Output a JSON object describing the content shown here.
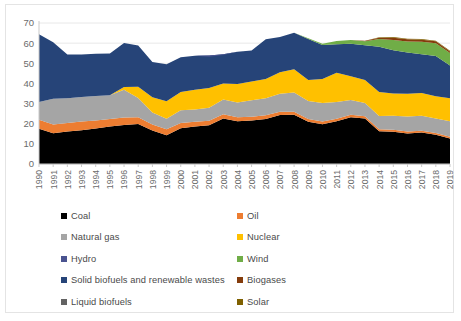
{
  "chart_data": {
    "type": "area",
    "stacked": true,
    "title": "",
    "subtitle": "",
    "xlabel": "",
    "ylabel": "",
    "ylim": [
      0,
      70
    ],
    "yticks": [
      0,
      10,
      20,
      30,
      40,
      50,
      60,
      70
    ],
    "ytick_labels": [
      "0",
      "10",
      "20",
      "30",
      "40",
      "50",
      "60",
      "70"
    ],
    "grid": true,
    "grid_axis": "y",
    "legend_position": "bottom",
    "legend_columns": 2,
    "categories": [
      "1990",
      "1991",
      "1992",
      "1993",
      "1994",
      "1995",
      "1996",
      "1997",
      "1998",
      "1999",
      "2000",
      "2001",
      "2002",
      "2003",
      "2004",
      "2005",
      "2006",
      "2007",
      "2008",
      "2009",
      "2010",
      "2011",
      "2012",
      "2013",
      "2014",
      "2015",
      "2016",
      "2017",
      "2018",
      "2019"
    ],
    "series": [
      {
        "name": "Coal",
        "color": "#000000",
        "values": [
          17.5,
          15.3,
          16.1,
          16.8,
          17.6,
          18.6,
          19.4,
          19.8,
          16.6,
          14.3,
          17.8,
          18.6,
          19.2,
          22.6,
          21.2,
          21.6,
          22.4,
          24.3,
          24.5,
          21.0,
          19.7,
          21.2,
          23.2,
          22.6,
          16.2,
          16.0,
          15.1,
          15.6,
          14.5,
          12.6
        ]
      },
      {
        "name": "Oil",
        "color": "#ED7D31",
        "values": [
          4.5,
          4.3,
          4.3,
          4.3,
          4.0,
          3.8,
          3.7,
          3.4,
          3.0,
          2.9,
          2.6,
          2.4,
          2.3,
          2.1,
          2.0,
          1.9,
          1.8,
          1.6,
          1.5,
          1.4,
          1.4,
          1.3,
          1.2,
          1.1,
          1.1,
          1.0,
          1.0,
          0.9,
          0.9,
          0.9
        ]
      },
      {
        "name": "Natural gas",
        "color": "#A5A5A5",
        "values": [
          8.8,
          12.8,
          12.3,
          12.2,
          12.1,
          11.7,
          13.8,
          9.6,
          6.0,
          5.3,
          6.3,
          6.0,
          6.4,
          7.3,
          7.3,
          8.2,
          8.4,
          9.0,
          9.5,
          8.9,
          9.2,
          8.3,
          7.4,
          6.6,
          6.5,
          6.9,
          7.5,
          7.5,
          7.2,
          7.7
        ]
      },
      {
        "name": "Nuclear",
        "color": "#FFC000",
        "values": [
          0.0,
          0.0,
          0.0,
          0.0,
          0.0,
          0.0,
          1.3,
          5.6,
          7.6,
          8.6,
          9.1,
          9.8,
          9.8,
          8.0,
          9.2,
          9.3,
          9.6,
          10.7,
          11.5,
          10.4,
          11.9,
          14.5,
          11.8,
          11.4,
          11.9,
          11.1,
          11.3,
          11.3,
          11.0,
          11.5
        ]
      },
      {
        "name": "Hydro",
        "color": "#4A5390"
      },
      {
        "name": "Wind",
        "color": "#70AD47",
        "values": [
          0.0,
          0.0,
          0.0,
          0.0,
          0.0,
          0.0,
          0.0,
          0.0,
          0.0,
          0.0,
          0.0,
          0.0,
          0.0,
          0.0,
          0.0,
          0.0,
          0.0,
          0.0,
          0.0,
          0.3,
          0.6,
          1.6,
          1.8,
          2.0,
          3.8,
          5.1,
          5.4,
          6.2,
          6.3,
          6.2
        ]
      },
      {
        "name": "Solid biofuels and renewable wastes",
        "color": "#264478",
        "values": [
          33.6,
          28.0,
          21.6,
          21.1,
          21.0,
          20.8,
          21.9,
          20.4,
          17.4,
          18.4,
          17.2,
          17.0,
          16.2,
          14.5,
          16.0,
          15.4,
          19.7,
          17.5,
          18.1,
          20.4,
          16.9,
          14.2,
          16.1,
          17.3,
          22.5,
          21.5,
          20.5,
          19.2,
          20.0,
          16.2
        ]
      },
      {
        "name": "Biogases",
        "color": "#843C0C",
        "values": [
          0.0,
          0.0,
          0.0,
          0.0,
          0.0,
          0.0,
          0.0,
          0.0,
          0.0,
          0.0,
          0.0,
          0.0,
          0.0,
          0.0,
          0.0,
          0.0,
          0.0,
          0.0,
          0.0,
          0.0,
          0.0,
          0.0,
          0.0,
          0.2,
          0.7,
          1.1,
          1.1,
          1.0,
          1.0,
          0.8
        ]
      },
      {
        "name": "Liquid biofuels",
        "color": "#636363"
      },
      {
        "name": "Solar",
        "color": "#7F6000",
        "values": [
          0.0,
          0.0,
          0.0,
          0.0,
          0.0,
          0.0,
          0.0,
          0.0,
          0.0,
          0.0,
          0.0,
          0.0,
          0.0,
          0.0,
          0.0,
          0.0,
          0.0,
          0.0,
          0.0,
          0.0,
          0.0,
          0.0,
          0.0,
          0.0,
          0.2,
          0.3,
          0.3,
          0.3,
          0.3,
          0.3
        ]
      }
    ],
    "stack_order": [
      "Coal",
      "Oil",
      "Natural gas",
      "Nuclear",
      "Solid biofuels and renewable wastes",
      "Wind",
      "Biogases",
      "Solar"
    ],
    "totals": [
      64.4,
      60.4,
      54.3,
      54.4,
      54.7,
      54.9,
      60.1,
      58.8,
      50.6,
      49.5,
      53.0,
      53.8,
      53.3,
      54.1,
      55.7,
      56.4,
      61.9,
      63.1,
      65.1,
      62.4,
      59.7,
      61.1,
      61.5,
      61.2,
      62.9,
      63.0,
      62.2,
      62.0,
      61.2,
      56.2
    ]
  },
  "legend": {
    "items": [
      {
        "label": "Coal",
        "color": "#000000"
      },
      {
        "label": "Oil",
        "color": "#ED7D31"
      },
      {
        "label": "Natural gas",
        "color": "#A5A5A5"
      },
      {
        "label": "Nuclear",
        "color": "#FFC000"
      },
      {
        "label": "Hydro",
        "color": "#4A5390"
      },
      {
        "label": "Wind",
        "color": "#70AD47"
      },
      {
        "label": "Solid biofuels and renewable wastes",
        "color": "#264478"
      },
      {
        "label": "Biogases",
        "color": "#843C0C"
      },
      {
        "label": "Liquid biofuels",
        "color": "#636363"
      },
      {
        "label": "Solar",
        "color": "#7F6000"
      }
    ]
  }
}
